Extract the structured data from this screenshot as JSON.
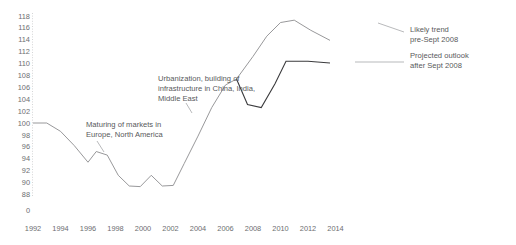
{
  "chart_data": {
    "type": "line",
    "title": "",
    "subtitle": "",
    "xlabel": "",
    "ylabel": "",
    "xlim": [
      1992,
      2015
    ],
    "ylim": [
      88,
      118
    ],
    "grid": false,
    "legend_position": "right-inline-annotations",
    "y_axis_note": "broken axis: a 0 tick is shown below the 88 tick",
    "x_ticks": [
      "1992",
      "1994",
      "1996",
      "1998",
      "2000",
      "2002",
      "2004",
      "2006",
      "2008",
      "2010",
      "2012",
      "2014"
    ],
    "y_ticks": [
      "118",
      "116",
      "114",
      "112",
      "110",
      "108",
      "106",
      "104",
      "102",
      "100",
      "98",
      "96",
      "94",
      "92",
      "90",
      "88",
      "0"
    ],
    "x": [
      1992,
      1993,
      1994,
      1995,
      1996,
      1997,
      1998,
      1999,
      2000,
      2001,
      2002,
      2003,
      2004,
      2005,
      2006,
      2007
    ],
    "series": [
      {
        "name": "Historical",
        "color": "#8c8c8e",
        "x": [
          1992,
          1993,
          1994,
          1995,
          1996,
          1996.6,
          1997.4,
          1998.2,
          1999,
          1999.8,
          2000.6,
          2001.4,
          2002.2,
          2003,
          2004,
          2005,
          2006,
          2006.8
        ],
        "values": [
          100,
          100,
          98.6,
          96.2,
          93.4,
          95.2,
          94.6,
          91.2,
          89.4,
          89.3,
          91.2,
          89.4,
          89.5,
          93.2,
          97.8,
          102.6,
          106.4,
          107.4
        ]
      },
      {
        "name": "Likely trend pre-Sept 2008",
        "color": "#8c8c8e",
        "x": [
          2006.8,
          2008,
          2009,
          2010,
          2011,
          2012.2,
          2013.6
        ],
        "values": [
          107.4,
          111.2,
          114.6,
          116.9,
          117.3,
          115.6,
          113.9
        ]
      },
      {
        "name": "Projected outlook after Sept 2008",
        "color": "#3b3b3d",
        "x": [
          2006.8,
          2007.6,
          2008.6,
          2009.6,
          2010.4,
          2012,
          2013.6
        ],
        "values": [
          107.4,
          103.1,
          102.6,
          106.6,
          110.4,
          110.4,
          110.1
        ]
      }
    ],
    "annotations": [
      {
        "id": "maturing-markets",
        "lines": [
          "Maturing of markets in",
          "Europe, North America"
        ],
        "points_to_year": 1996.6,
        "points_to_value": 95.2
      },
      {
        "id": "urbanization",
        "lines": [
          "Urbanization, building of",
          "infrastructure in China, India,",
          "Middle East"
        ],
        "points_to_year": 2003.6,
        "points_to_value": 95.5
      },
      {
        "id": "likely-trend",
        "lines": [
          "Likely trend",
          "pre-Sept 2008"
        ],
        "points_to_year": 2013.6,
        "points_to_value": 113.9
      },
      {
        "id": "projected-outlook",
        "lines": [
          "Projected outlook",
          "after Sept 2008"
        ],
        "points_to_year": 2013.6,
        "points_to_value": 110.1
      }
    ]
  },
  "axis": {
    "y_labels": [
      "118",
      "116",
      "114",
      "112",
      "110",
      "108",
      "106",
      "104",
      "102",
      "100",
      "98",
      "96",
      "94",
      "92",
      "90",
      "88"
    ],
    "y_zero_label": "0",
    "x_labels": [
      "1992",
      "1994",
      "1996",
      "1998",
      "2000",
      "2002",
      "2004",
      "2006",
      "2008",
      "2010",
      "2012",
      "2014"
    ]
  },
  "annotations": {
    "maturing": {
      "line1": "Maturing of markets in",
      "line2": "Europe, North America"
    },
    "urbanization": {
      "line1": "Urbanization, building of",
      "line2": "infrastructure in China, India,",
      "line3": "Middle East"
    },
    "likely_trend": {
      "line1": "Likely trend",
      "line2": "pre-Sept 2008"
    },
    "projected_outlook": {
      "line1": "Projected outlook",
      "line2": "after Sept 2008"
    }
  },
  "colors": {
    "likely_trend_line": "#8c8c8e",
    "projected_line": "#3b3b3d",
    "text": "#58595b",
    "tick_text": "#6d6e71",
    "background": "#ffffff"
  }
}
